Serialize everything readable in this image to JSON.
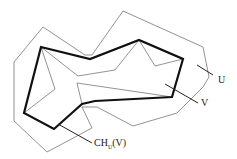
{
  "diagram": {
    "labels": {
      "U": "U",
      "V": "V",
      "ch_main": "CH",
      "ch_sub": "U",
      "ch_arg": "(V)"
    },
    "colors": {
      "thin": "#777777",
      "thick": "#111111",
      "background": "#ffffff"
    },
    "polygons": {
      "U": "43,27 14,62 14,121 47,152 92,128 82,107 97,107 133,126 177,113 203,87 209,77 203,47 123,11 92,55 85,55",
      "CH": "41,47 90,59 139,40 183,59 172,97 95,101 82,104 54,129 24,113",
      "V": "41,47 55,89 24,113 54,129 82,104 77,83 172,97 183,59 155,66 139,40 115,70 78,76"
    }
  }
}
